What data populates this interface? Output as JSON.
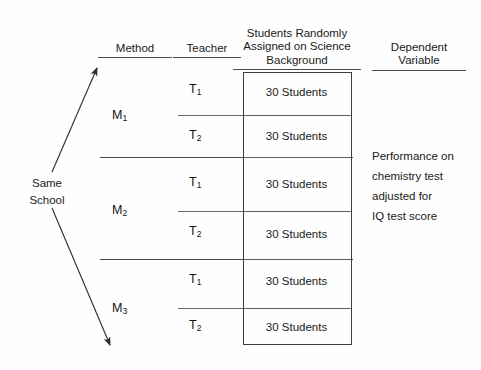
{
  "figure": {
    "type": "experimental-design-diagram",
    "background_color": "#fefefe",
    "line_color": "#3d3d3d"
  },
  "headers": {
    "method": "Method",
    "teacher": "Teacher",
    "students": "Students Randomly\nAssigned on Science\nBackground",
    "dependent": "Dependent\nVariable"
  },
  "source": {
    "label": "Same\nSchool"
  },
  "methods": [
    {
      "label": "M",
      "subscript": "1"
    },
    {
      "label": "M",
      "subscript": "2"
    },
    {
      "label": "M",
      "subscript": "3"
    }
  ],
  "teachers": [
    {
      "label": "T",
      "subscript": "1"
    },
    {
      "label": "T",
      "subscript": "2"
    },
    {
      "label": "T",
      "subscript": "1"
    },
    {
      "label": "T",
      "subscript": "2"
    },
    {
      "label": "T",
      "subscript": "1"
    },
    {
      "label": "T",
      "subscript": "2"
    }
  ],
  "cells": [
    {
      "text": "30 Students"
    },
    {
      "text": "30 Students"
    },
    {
      "text": "30 Students"
    },
    {
      "text": "30 Students"
    },
    {
      "text": "30 Students"
    },
    {
      "text": "30 Students"
    }
  ],
  "dependent_variable": {
    "text": "Performance on\nchemistry test\nadjusted for\nIQ test score"
  },
  "arrows": {
    "up": "arrow-up-right",
    "down": "arrow-down-right"
  }
}
